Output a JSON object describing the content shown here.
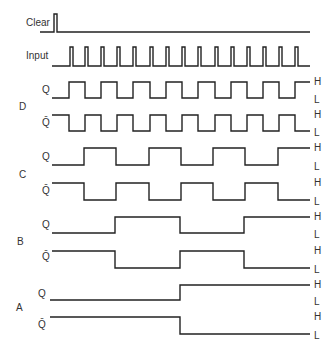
{
  "colors": {
    "line": "#222222",
    "text": "#333333",
    "background": "#ffffff"
  },
  "level_labels": {
    "high": "H",
    "low": "L"
  },
  "signals": [
    {
      "id": "clear",
      "label": "Clear",
      "label_x": 26,
      "label_y": 18,
      "low_y": 32,
      "high_y": 14,
      "x_start": 40,
      "x_end": 310,
      "edges": [
        54,
        57
      ]
    },
    {
      "id": "input",
      "label": "Input",
      "label_x": 26,
      "label_y": 51,
      "low_y": 66,
      "high_y": 47,
      "x_start": 52,
      "x_end": 310,
      "pulses": [
        70,
        85,
        101,
        117,
        133,
        150,
        166,
        182,
        198,
        215,
        231,
        247,
        263,
        279,
        295
      ],
      "pulse_width": 3
    },
    {
      "id": "D_Q",
      "group": "D",
      "label": "Q",
      "label_x": 42,
      "label_y": 85,
      "high_y": 82,
      "low_y": 98,
      "x_start": 52,
      "x_end": 310,
      "initial": "L",
      "edges": [
        69,
        85,
        101,
        117,
        133,
        150,
        166,
        182,
        198,
        215,
        231,
        247,
        263,
        279,
        295
      ],
      "show_hl": true
    },
    {
      "id": "D_Qbar",
      "group": "D",
      "label": "Q̄",
      "label_x": 42,
      "label_y": 118,
      "high_y": 115,
      "low_y": 131,
      "x_start": 52,
      "x_end": 310,
      "initial": "H",
      "edges": [
        69,
        85,
        101,
        117,
        133,
        150,
        166,
        182,
        198,
        215,
        231,
        247,
        263,
        279,
        295
      ],
      "show_hl": true
    },
    {
      "id": "C_Q",
      "group": "C",
      "label": "Q",
      "label_x": 42,
      "label_y": 152,
      "high_y": 148,
      "low_y": 165,
      "x_start": 52,
      "x_end": 310,
      "initial": "L",
      "edges": [
        84,
        116,
        149,
        181,
        213,
        245,
        278
      ],
      "show_hl": true
    },
    {
      "id": "C_Qbar",
      "group": "C",
      "label": "Q̄",
      "label_x": 42,
      "label_y": 186,
      "high_y": 183,
      "low_y": 200,
      "x_start": 52,
      "x_end": 310,
      "initial": "H",
      "edges": [
        84,
        116,
        149,
        181,
        213,
        245,
        278
      ],
      "show_hl": true
    },
    {
      "id": "B_Q",
      "group": "B",
      "label": "Q",
      "label_x": 42,
      "label_y": 220,
      "high_y": 217,
      "low_y": 233,
      "x_start": 52,
      "x_end": 310,
      "initial": "L",
      "edges": [
        115,
        180,
        244
      ],
      "show_hl": true
    },
    {
      "id": "B_Qbar",
      "group": "B",
      "label": "Q̄",
      "label_x": 42,
      "label_y": 252,
      "high_y": 251,
      "low_y": 268,
      "x_start": 52,
      "x_end": 310,
      "initial": "H",
      "edges": [
        115,
        180,
        244
      ],
      "show_hl": true
    },
    {
      "id": "A_Q",
      "group": "A",
      "label": "Q",
      "label_x": 38,
      "label_y": 289,
      "high_y": 285,
      "low_y": 300,
      "x_start": 50,
      "x_end": 310,
      "initial": "L",
      "edges": [
        180
      ],
      "show_hl": true
    },
    {
      "id": "A_Qbar",
      "group": "A",
      "label": "Q̄",
      "label_x": 38,
      "label_y": 320,
      "high_y": 317,
      "low_y": 334,
      "x_start": 50,
      "x_end": 310,
      "initial": "H",
      "edges": [
        180
      ],
      "show_hl": true
    }
  ],
  "groups": [
    {
      "label": "D",
      "x": 19,
      "y": 102
    },
    {
      "label": "C",
      "x": 19,
      "y": 170
    },
    {
      "label": "B",
      "x": 17,
      "y": 237
    },
    {
      "label": "A",
      "x": 16,
      "y": 303
    }
  ]
}
